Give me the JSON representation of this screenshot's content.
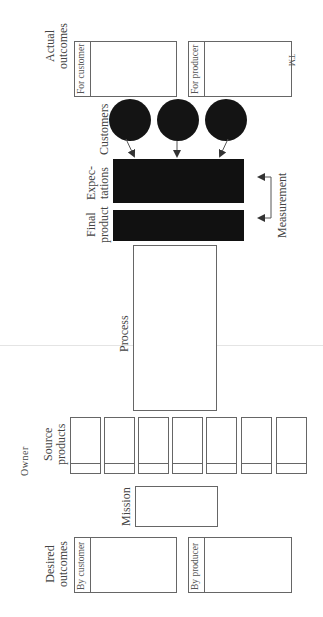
{
  "diagram": {
    "actual_outcomes": {
      "label_line1": "Actual",
      "label_line2": "outcomes",
      "for_customer": "For customer",
      "for_producer": "For producer",
      "trademark": "TM"
    },
    "customers": {
      "label": "Customers",
      "count": 3
    },
    "expectations": {
      "label_line1": "Expec-",
      "label_line2": "tations"
    },
    "final_product": {
      "label_line1": "Final",
      "label_line2": "product"
    },
    "measurement": {
      "label": "Measurement"
    },
    "process": {
      "label": "Process"
    },
    "source_products": {
      "label_line1": "Source",
      "label_line2": "products",
      "count": 7,
      "owner_letters": [
        "O",
        "w",
        "n",
        "e",
        "r"
      ]
    },
    "mission": {
      "label": "Mission"
    },
    "desired_outcomes": {
      "label_line1": "Desired",
      "label_line2": "outcomes",
      "by_customer": "By customer",
      "by_producer": "By producer"
    },
    "colors": {
      "line": "#666666",
      "fill_dark": "#111111",
      "background": "#ffffff"
    }
  }
}
